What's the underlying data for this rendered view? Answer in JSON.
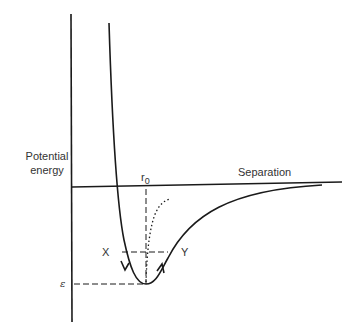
{
  "diagram": {
    "y_axis_label_line1": "Potential",
    "y_axis_label_line2": "energy",
    "x_axis_label": "Separation",
    "r0_label": "r",
    "r0_subscript": "0",
    "epsilon_label": "ε",
    "point_x_label": "X",
    "point_y_label": "Y",
    "colors": {
      "line": "#1a1a1a",
      "text": "#333333",
      "background": "#ffffff"
    }
  }
}
